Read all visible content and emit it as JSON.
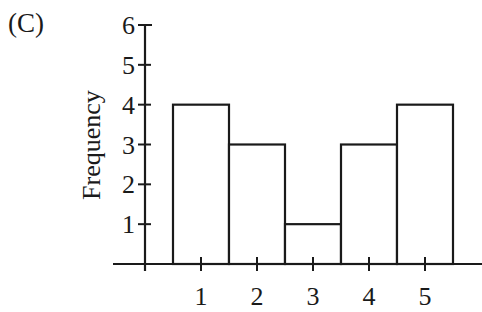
{
  "figure": {
    "label": "(C)"
  },
  "chart_data": {
    "type": "bar",
    "subtype": "histogram",
    "title": "",
    "panel_label": "(C)",
    "xlabel": "",
    "ylabel": "Frequency",
    "categories": [
      "1",
      "2",
      "3",
      "4",
      "5"
    ],
    "values": [
      4,
      3,
      1,
      3,
      4
    ],
    "x_ticks": [
      "1",
      "2",
      "3",
      "4",
      "5"
    ],
    "y_ticks": [
      "1",
      "2",
      "3",
      "4",
      "5",
      "6"
    ],
    "ylim": [
      0,
      6
    ],
    "grid": false,
    "legend": null,
    "bar_fill": "#ffffff",
    "bar_stroke": "#1a1a1a"
  }
}
